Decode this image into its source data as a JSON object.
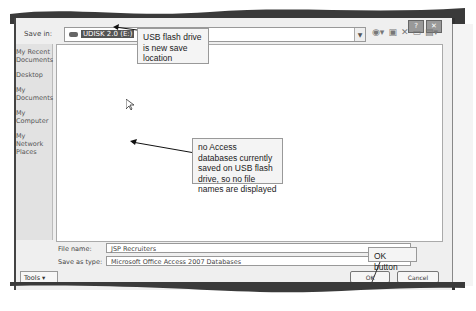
{
  "dialog": {
    "save_in_label": "Save in:",
    "save_in_value": "UDISK 2.0 (E:)",
    "title_controls": [
      "?",
      "✕"
    ],
    "toolbar_icons": [
      "back-icon",
      "up-folder-icon",
      "delete-icon",
      "new-folder-icon",
      "views-icon"
    ],
    "places": [
      {
        "label": "My Recent Documents"
      },
      {
        "label": "Desktop"
      },
      {
        "label": "My Documents"
      },
      {
        "label": "My Computer"
      },
      {
        "label": "My Network Places"
      }
    ],
    "file_name_label": "File name:",
    "file_name_value": "JSP Recruiters",
    "save_as_type_label": "Save as type:",
    "save_as_type_value": "Microsoft Office Access 2007 Databases",
    "tools_label": "Tools",
    "ok_label": "OK",
    "cancel_label": "Cancel"
  },
  "callouts": {
    "usb": "USB flash drive is new save location",
    "no_files": "no Access databases currently saved on USB flash drive, so no file names are displayed",
    "ok": "OK button"
  }
}
